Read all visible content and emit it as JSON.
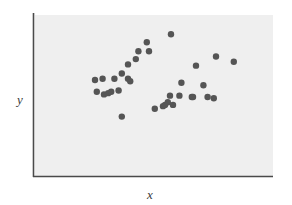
{
  "chart_data": {
    "type": "scatter",
    "title": "",
    "subtitle": "",
    "xlabel": "x",
    "ylabel": "y",
    "xlim": [
      0,
      100
    ],
    "ylim": [
      0,
      100
    ],
    "grid": false,
    "legend": null,
    "marker": {
      "shape": "circle",
      "color": "#555555",
      "size": 3.2
    },
    "axes": {
      "x_ticks": [],
      "y_ticks": [],
      "x_tick_labels": [],
      "y_tick_labels": [],
      "spines": [
        "left",
        "bottom"
      ],
      "axis_color": "#4a4a4a",
      "plot_background": "#efefef"
    },
    "annotations": [],
    "points": [
      {
        "x": 17.0,
        "y": 59.1
      },
      {
        "x": 20.8,
        "y": 60.2
      },
      {
        "x": 17.9,
        "y": 48.9
      },
      {
        "x": 21.5,
        "y": 46.6
      },
      {
        "x": 23.6,
        "y": 47.7
      },
      {
        "x": 25.1,
        "y": 48.9
      },
      {
        "x": 28.8,
        "y": 50.0
      },
      {
        "x": 26.7,
        "y": 60.2
      },
      {
        "x": 30.4,
        "y": 64.8
      },
      {
        "x": 33.5,
        "y": 60.2
      },
      {
        "x": 34.6,
        "y": 58.0
      },
      {
        "x": 33.5,
        "y": 72.7
      },
      {
        "x": 37.4,
        "y": 77.3
      },
      {
        "x": 38.7,
        "y": 84.1
      },
      {
        "x": 44.0,
        "y": 84.1
      },
      {
        "x": 42.9,
        "y": 92.0
      },
      {
        "x": 55.0,
        "y": 98.9
      },
      {
        "x": 30.4,
        "y": 27.3
      },
      {
        "x": 46.9,
        "y": 34.1
      },
      {
        "x": 51.0,
        "y": 36.4
      },
      {
        "x": 52.0,
        "y": 37.5
      },
      {
        "x": 53.4,
        "y": 39.8
      },
      {
        "x": 54.5,
        "y": 45.5
      },
      {
        "x": 56.0,
        "y": 37.5
      },
      {
        "x": 59.2,
        "y": 45.5
      },
      {
        "x": 60.2,
        "y": 56.8
      },
      {
        "x": 65.4,
        "y": 44.3
      },
      {
        "x": 66.0,
        "y": 44.3
      },
      {
        "x": 67.5,
        "y": 71.6
      },
      {
        "x": 71.2,
        "y": 54.5
      },
      {
        "x": 73.3,
        "y": 44.3
      },
      {
        "x": 76.4,
        "y": 43.2
      },
      {
        "x": 77.5,
        "y": 79.5
      },
      {
        "x": 86.4,
        "y": 75.0
      }
    ]
  },
  "labels": {
    "x": "x",
    "y": "y"
  }
}
